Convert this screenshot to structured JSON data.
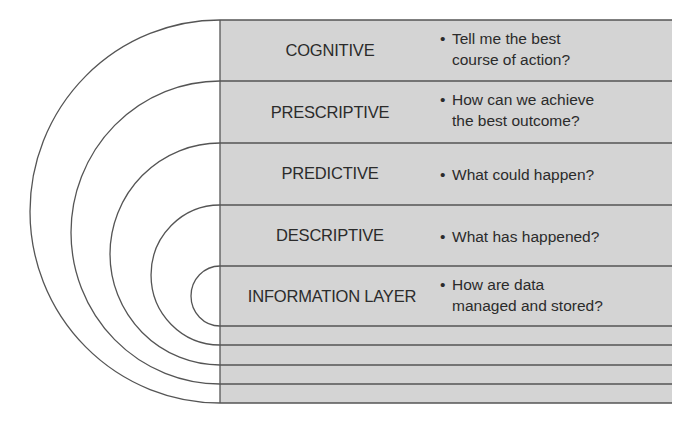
{
  "diagram": {
    "type": "analytics-maturity-layers",
    "colors": {
      "panel": "#d4d4d4",
      "line": "#555555",
      "text": "#2b2b2b"
    },
    "layers": [
      {
        "label": "COGNITIVE",
        "question": "Tell me the best course of action?",
        "question_lines": [
          "Tell me the best",
          "course of action?"
        ]
      },
      {
        "label": "PRESCRIPTIVE",
        "question": "How can we achieve the best outcome?",
        "question_lines": [
          "How can we achieve",
          "the best outcome?"
        ]
      },
      {
        "label": "PREDICTIVE",
        "question": "What could happen?",
        "question_lines": [
          "What could happen?"
        ]
      },
      {
        "label": "DESCRIPTIVE",
        "question": "What has happened?",
        "question_lines": [
          "What has happened?"
        ]
      },
      {
        "label": "INFORMATION LAYER",
        "question": "How are data managed and stored?",
        "question_lines": [
          "How are data",
          "managed and stored?"
        ]
      }
    ],
    "bullet": "•"
  }
}
